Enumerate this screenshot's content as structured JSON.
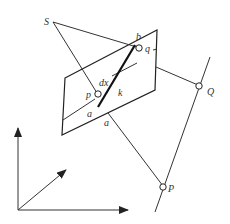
{
  "diagram": {
    "title": "",
    "labels": {
      "S": "S",
      "b": "b",
      "q": "q",
      "dx": "dx",
      "p": "p",
      "k": "k",
      "a_inner": "a",
      "a_outer": "a",
      "Q": "Q",
      "P": "P"
    },
    "elements": [
      "plane parallelogram",
      "projection center S",
      "line k (thick segment on plane)",
      "points p, q on plane",
      "line through P and Q",
      "coordinate axes (3 arrows)"
    ],
    "colors": {
      "stroke": "#222222",
      "background": "#ffffff"
    }
  }
}
